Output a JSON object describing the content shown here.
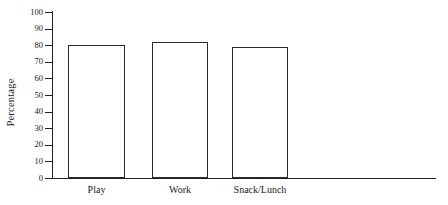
{
  "chart_data": {
    "type": "bar",
    "title": "",
    "subtitle": "",
    "xlabel": "",
    "ylabel": "Percentage",
    "categories": [
      "Play",
      "Work",
      "Snack/Lunch"
    ],
    "values": [
      80,
      82,
      79
    ],
    "ylim": [
      0,
      100
    ],
    "ytick_labels": [
      "0",
      "10",
      "20",
      "30",
      "40",
      "50",
      "60",
      "70",
      "80",
      "90",
      "100"
    ],
    "ytick_values": [
      0,
      10,
      20,
      30,
      40,
      50,
      60,
      70,
      80,
      90,
      100
    ],
    "grid": false,
    "legend": null,
    "legend_position": "none",
    "bar_fill_color": "#ffffff",
    "bar_edge_color": "#2b2b2b",
    "axis_color": "#222222",
    "background_color": "#ffffff",
    "annotations": []
  },
  "figure": {
    "y_axis_title": "Percentage",
    "plot_name": "percentage-bar-chart"
  }
}
